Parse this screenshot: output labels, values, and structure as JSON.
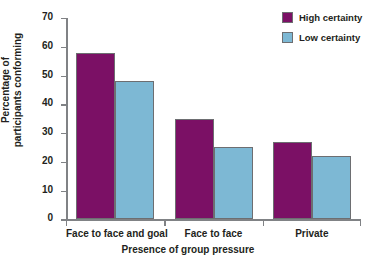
{
  "chart_data": {
    "type": "bar",
    "title": "",
    "subtitle": "",
    "xlabel": "Presence of group pressure",
    "ylabel": "Percentage of participants conforming",
    "ylabel_line1": "Percentage of",
    "ylabel_line2": "participants conforming",
    "categories": [
      "Face to face and goal",
      "Face to face",
      "Private"
    ],
    "series": [
      {
        "name": "High certainty",
        "color": "#7b1065",
        "values": [
          58,
          35,
          27
        ]
      },
      {
        "name": "Low certainty",
        "color": "#7db8d4",
        "values": [
          48,
          25,
          22
        ]
      }
    ],
    "ylim": [
      0,
      70
    ],
    "yticks": [
      0,
      10,
      20,
      30,
      40,
      50,
      60,
      70
    ],
    "ytick_labels": [
      "0",
      "10",
      "20",
      "30",
      "40",
      "50",
      "60",
      "70"
    ],
    "grid": false,
    "legend_position": "top-right",
    "legend_entries": [
      {
        "label": "High certainty",
        "color": "#7b1065"
      },
      {
        "label": "Low certainty",
        "color": "#7db8d4"
      }
    ],
    "axis_color": "#808285",
    "bar_edge_color": "#6d6e71",
    "text_color": "#231f20",
    "background": "#ffffff"
  }
}
